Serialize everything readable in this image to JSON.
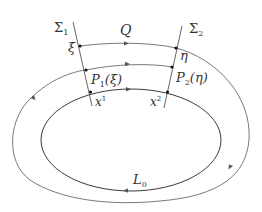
{
  "diagram": {
    "labels": {
      "sigma1": "Σ",
      "sigma1_sub": "1",
      "sigma2": "Σ",
      "sigma2_sub": "2",
      "Q": "Q",
      "xi": "ξ",
      "eta": "η",
      "P1": "P",
      "P1_sub": "1",
      "P1_arg": "(ξ)",
      "P2": "P",
      "P2_sub": "2",
      "P2_arg": "(η)",
      "x1": "x",
      "x1_sup": "1",
      "x2": "x",
      "x2_sup": "2",
      "L0": "L",
      "L0_sub": "0"
    },
    "elements": [
      {
        "id": "sigma1",
        "type": "cross-section line"
      },
      {
        "id": "sigma2",
        "type": "cross-section line"
      },
      {
        "id": "L0",
        "type": "closed orbit (ellipse)"
      },
      {
        "id": "Q",
        "type": "orbit segment from Σ1 to Σ2"
      },
      {
        "id": "outer-orbit",
        "type": "trajectory loop returning to Σ1"
      }
    ],
    "colors": {
      "line": "#6a6a6a",
      "text": "#333333",
      "points": "#111111"
    }
  }
}
